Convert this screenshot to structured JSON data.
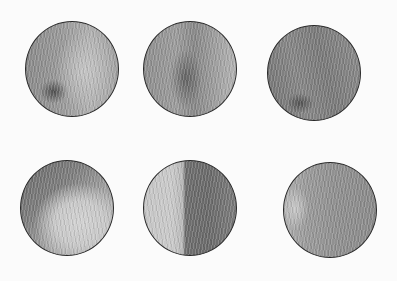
{
  "image": {
    "description": "Six pencil-shaded circular disks arranged in two rows of three on white paper",
    "background": "#fbfbfb",
    "outline_color": "#2a2a2a",
    "disks": [
      {
        "row": 1,
        "col": 1,
        "cx": 72,
        "cy": 69,
        "shading": "mid-grey with lighter center-right region and darker spot lower-left"
      },
      {
        "row": 1,
        "col": 2,
        "cx": 190,
        "cy": 69,
        "shading": "mid-grey with streaky darker bands, lighter limb on right"
      },
      {
        "row": 1,
        "col": 3,
        "cx": 314,
        "cy": 73,
        "shading": "darker grey overall with diagonal streaks"
      },
      {
        "row": 2,
        "col": 1,
        "cx": 68,
        "cy": 208,
        "shading": "light lower-right region, darker upper-left crescent"
      },
      {
        "row": 2,
        "col": 2,
        "cx": 190,
        "cy": 209,
        "shading": "light left half, dark right half (half-lit)"
      },
      {
        "row": 2,
        "col": 3,
        "cx": 330,
        "cy": 210,
        "shading": "mid-grey with lighter left edge and streaks"
      }
    ]
  }
}
